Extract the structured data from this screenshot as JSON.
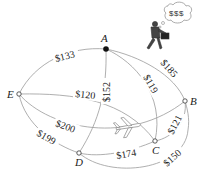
{
  "diagram": {
    "type": "weighted-graph",
    "nodes": [
      {
        "id": "A",
        "label": "A",
        "x": 106,
        "y": 49,
        "filled": true
      },
      {
        "id": "B",
        "label": "B",
        "x": 185,
        "y": 101,
        "filled": false
      },
      {
        "id": "C",
        "label": "C",
        "x": 155,
        "y": 141,
        "filled": false
      },
      {
        "id": "D",
        "label": "D",
        "x": 79,
        "y": 153,
        "filled": false
      },
      {
        "id": "E",
        "label": "E",
        "x": 19,
        "y": 94,
        "filled": false
      }
    ],
    "edges": [
      {
        "from": "A",
        "to": "E",
        "label": "$133"
      },
      {
        "from": "A",
        "to": "B",
        "label": "$185"
      },
      {
        "from": "A",
        "to": "C",
        "label": "$119"
      },
      {
        "from": "A",
        "to": "D",
        "label": "$152"
      },
      {
        "from": "E",
        "to": "C",
        "label": "$120"
      },
      {
        "from": "E",
        "to": "B",
        "label": "$200"
      },
      {
        "from": "E",
        "to": "D",
        "label": "$199"
      },
      {
        "from": "D",
        "to": "C",
        "label": "$174"
      },
      {
        "from": "B",
        "to": "C",
        "label": "$121"
      },
      {
        "from": "D",
        "to": "B",
        "label": "$150"
      }
    ],
    "bubble_text": "$$$",
    "decorations": [
      "businessman-with-briefcase",
      "airplane"
    ]
  }
}
